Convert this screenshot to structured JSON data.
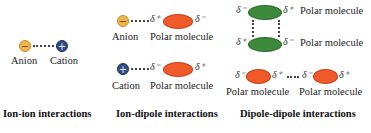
{
  "panels": {
    "ion_ion": {
      "anion_symbol": "−",
      "cation_symbol": "+",
      "anion_label": "Anion",
      "cation_label": "Cation",
      "title": "Ion-ion interactions"
    },
    "ion_dipole": {
      "row1": {
        "ion_symbol": "−",
        "ion_label": "Anion",
        "near_delta": "δ⁺",
        "far_delta": "δ⁻",
        "molecule_label": "Polar molecule"
      },
      "row2": {
        "ion_symbol": "+",
        "ion_label": "Cation",
        "near_delta": "δ⁻",
        "far_delta": "δ⁺",
        "molecule_label": "Polar molecule"
      },
      "title": "Ion-dipole interactions"
    },
    "dipole_dipole": {
      "top": {
        "left_delta": "δ⁻",
        "right_delta": "δ⁺",
        "label": "Polar molecule"
      },
      "bottom": {
        "left_delta": "δ⁺",
        "right_delta": "δ⁻",
        "label": "Polar molecule"
      },
      "pair": {
        "m1_left": "δ⁻",
        "m1_right": "δ⁺",
        "m1_label": "Polar molecule",
        "m2_left": "δ⁻",
        "m2_right": "δ⁺",
        "m2_label": "Polar molecule"
      },
      "title": "Dipole-dipole interactions"
    }
  },
  "colors": {
    "anion": "#f0b64a",
    "cation": "#2f4a86",
    "polar_orange": "#f05a28",
    "polar_green": "#3d8a3d"
  }
}
